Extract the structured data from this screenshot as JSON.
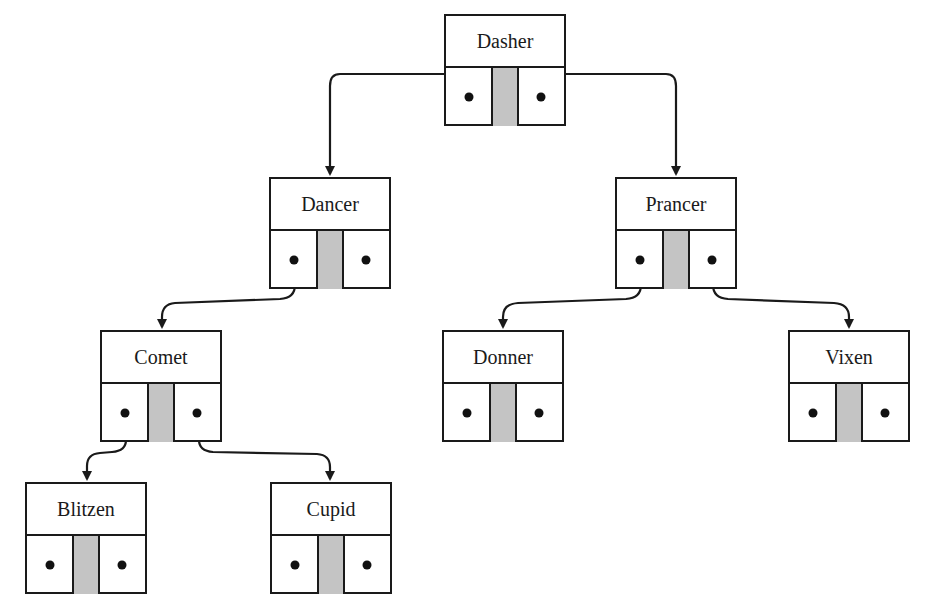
{
  "diagram": {
    "type": "binary-search-tree",
    "colors": {
      "line": "#1a1a1a",
      "middle_cell": "#c4c4c4",
      "background": "#ffffff"
    },
    "nodes": [
      {
        "id": "dasher",
        "label": "Dasher",
        "x": 444,
        "y": 14,
        "left": "dancer",
        "right": "prancer"
      },
      {
        "id": "dancer",
        "label": "Dancer",
        "x": 269,
        "y": 177,
        "left": "comet",
        "right": null
      },
      {
        "id": "prancer",
        "label": "Prancer",
        "x": 615,
        "y": 177,
        "left": "donner",
        "right": "vixen"
      },
      {
        "id": "comet",
        "label": "Comet",
        "x": 100,
        "y": 330,
        "left": "blitzen",
        "right": "cupid"
      },
      {
        "id": "donner",
        "label": "Donner",
        "x": 442,
        "y": 330,
        "left": null,
        "right": null
      },
      {
        "id": "vixen",
        "label": "Vixen",
        "x": 788,
        "y": 330,
        "left": null,
        "right": null
      },
      {
        "id": "blitzen",
        "label": "Blitzen",
        "x": 25,
        "y": 482,
        "left": null,
        "right": null
      },
      {
        "id": "cupid",
        "label": "Cupid",
        "x": 270,
        "y": 482,
        "left": null,
        "right": null
      }
    ]
  }
}
